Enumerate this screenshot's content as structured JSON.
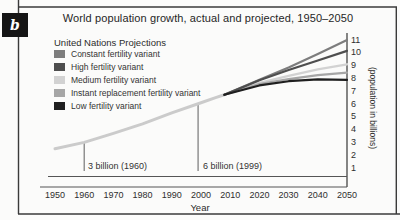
{
  "page": {
    "panel_label": "b"
  },
  "chart_data": {
    "type": "line",
    "title": "World population growth, actual and projected, 1950–2050",
    "xlabel": "Year",
    "ylabel": "(population in billions)",
    "legend_title": "United Nations Projections",
    "legend_position": "upper-left",
    "grid": false,
    "xlim": [
      1950,
      2050
    ],
    "ylim": [
      1,
      11
    ],
    "x_ticks": [
      1950,
      1960,
      1970,
      1980,
      1990,
      2000,
      2010,
      2020,
      2030,
      2040,
      2050
    ],
    "y_ticks": [
      1,
      2,
      3,
      4,
      5,
      6,
      7,
      8,
      9,
      10,
      11
    ],
    "series": [
      {
        "name": "Actual population",
        "in_legend": false,
        "color": "#cbcbcb",
        "width": 3,
        "x": [
          1950,
          1960,
          1970,
          1980,
          1990,
          2000,
          2005,
          2008
        ],
        "y": [
          2.5,
          3.0,
          3.7,
          4.45,
          5.3,
          6.1,
          6.5,
          6.72
        ]
      },
      {
        "name": "Constant fertility variant",
        "in_legend": true,
        "color": "#7d7d7d",
        "width": 2.2,
        "x": [
          2008,
          2020,
          2030,
          2040,
          2050
        ],
        "y": [
          6.72,
          7.9,
          8.85,
          9.9,
          11.0
        ]
      },
      {
        "name": "High fertility variant",
        "in_legend": true,
        "color": "#4e4e4e",
        "width": 2.2,
        "x": [
          2008,
          2020,
          2030,
          2040,
          2050
        ],
        "y": [
          6.72,
          7.85,
          8.65,
          9.4,
          10.15
        ]
      },
      {
        "name": "Medium fertility variant",
        "in_legend": true,
        "color": "#d2d2d2",
        "width": 2.4,
        "x": [
          2008,
          2020,
          2030,
          2040,
          2050
        ],
        "y": [
          6.72,
          7.65,
          8.2,
          8.7,
          9.1
        ]
      },
      {
        "name": "Instant replacement fertility variant",
        "in_legend": true,
        "color": "#a6a6a6",
        "width": 2.2,
        "x": [
          2008,
          2020,
          2030,
          2040,
          2050
        ],
        "y": [
          6.72,
          7.55,
          7.95,
          8.25,
          8.45
        ]
      },
      {
        "name": "Low fertility variant",
        "in_legend": true,
        "color": "#1f1f1f",
        "width": 2.2,
        "x": [
          2008,
          2020,
          2030,
          2040,
          2050
        ],
        "y": [
          6.72,
          7.45,
          7.78,
          7.93,
          7.88
        ]
      }
    ],
    "annotations": [
      {
        "text": "3 billion (1960)",
        "year": 1960,
        "value": 3.0
      },
      {
        "text": "6 billion (1999)",
        "year": 1999,
        "value": 6.0
      }
    ]
  }
}
